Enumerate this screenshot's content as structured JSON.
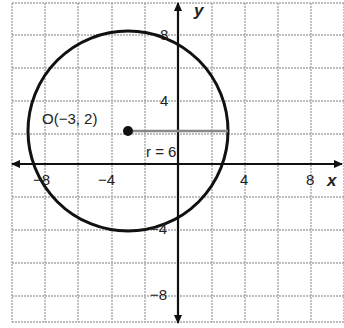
{
  "diagram": {
    "type": "coordinate-plane-circle",
    "axes": {
      "x_label": "x",
      "y_label": "y",
      "x_ticks": [
        "-8",
        "-4",
        "4",
        "8"
      ],
      "y_ticks": [
        "8",
        "4",
        "-4",
        "-8"
      ],
      "grid_step": 2
    },
    "circle": {
      "center_label": "O(−3, 2)",
      "center": [
        -3,
        2
      ],
      "radius": 6,
      "radius_label": "r = 6"
    },
    "colors": {
      "grid": "#a8a8a8",
      "axis": "#111111",
      "circle": "#111111",
      "radius_line": "#888888"
    }
  },
  "labels": {
    "center_text": "O(−3, 2)",
    "radius_text": "r = 6",
    "x_axis": "x",
    "y_axis": "y",
    "tick_x_neg8": "−8",
    "tick_x_neg4": "−4",
    "tick_x_4": "4",
    "tick_x_8": "8",
    "tick_y_8": "8",
    "tick_y_4": "4",
    "tick_y_neg4": "−4",
    "tick_y_neg8": "−8"
  }
}
